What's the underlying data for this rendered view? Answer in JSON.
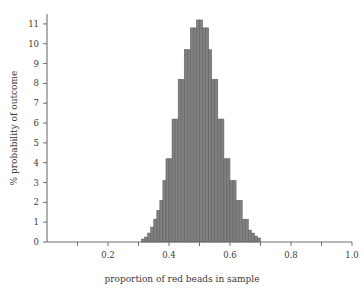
{
  "chart_data": {
    "type": "bar",
    "title": "",
    "subtitle": "",
    "xlabel": "proportion of red beads in sample",
    "ylabel": "% probability of outcome",
    "xlim": [
      0,
      1.0
    ],
    "ylim": [
      0,
      11.5
    ],
    "grid": false,
    "legend": null,
    "bar_color": "#808080",
    "bar_edge_color": "#5e5e5e",
    "axis_color": "#6e6e6e",
    "text_color": "#3a3a3a",
    "bin_width": 0.01,
    "x_tick_labels": [
      "0.2",
      "0.4",
      "0.6",
      "0.8",
      "1.0"
    ],
    "x_tick_values": [
      0.2,
      0.4,
      0.6,
      0.8,
      1.0
    ],
    "x_minor_tick_values": [
      0.1,
      0.3,
      0.5,
      0.7,
      0.9
    ],
    "y_tick_labels": [
      "0",
      "1",
      "2",
      "3",
      "4",
      "5",
      "6",
      "7",
      "8",
      "9",
      "10",
      "11"
    ],
    "y_tick_values": [
      0,
      1,
      2,
      3,
      4,
      5,
      6,
      7,
      8,
      9,
      10,
      11
    ],
    "categories": [
      0.31,
      0.32,
      0.33,
      0.34,
      0.35,
      0.36,
      0.37,
      0.38,
      0.39,
      0.4,
      0.41,
      0.42,
      0.43,
      0.44,
      0.45,
      0.46,
      0.47,
      0.48,
      0.49,
      0.5,
      0.51,
      0.52,
      0.53,
      0.54,
      0.55,
      0.56,
      0.57,
      0.58,
      0.59,
      0.6,
      0.61,
      0.62,
      0.63,
      0.64,
      0.65,
      0.66,
      0.67,
      0.68,
      0.69
    ],
    "values": [
      0.15,
      0.25,
      0.45,
      0.75,
      1.15,
      1.6,
      2.1,
      3.1,
      4.2,
      4.2,
      6.2,
      6.2,
      8.2,
      8.2,
      9.7,
      9.7,
      10.8,
      10.8,
      11.2,
      11.2,
      10.8,
      10.8,
      9.7,
      8.2,
      8.2,
      6.2,
      6.2,
      4.2,
      4.2,
      3.1,
      3.1,
      2.1,
      2.1,
      1.15,
      1.15,
      0.6,
      0.45,
      0.3,
      0.2
    ]
  },
  "axes": {
    "x_title": "proportion of red beads in sample",
    "y_title": "% probability of outcome"
  }
}
